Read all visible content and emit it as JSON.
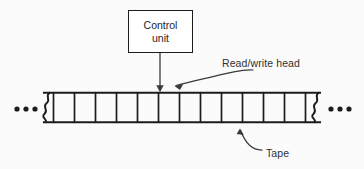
{
  "figure": {
    "background_color": "#fbfbfc",
    "ink_color": "#1c1c1c",
    "text_color": "#303030"
  },
  "control_unit": {
    "label_line1": "Control",
    "label_line2": "unit",
    "box": {
      "x": 128,
      "y": 10,
      "width": 65,
      "height": 43
    }
  },
  "connector": {
    "name": "control-unit-to-head-arrow",
    "from": {
      "x": 160,
      "y": 53
    },
    "to": {
      "x": 160,
      "y": 92
    },
    "arrowhead": "down"
  },
  "annotations": [
    {
      "id": "read-write-head",
      "label": "Read/write head",
      "text_x": 222,
      "text_y": 57,
      "arrow_from": {
        "x": 220,
        "y": 72
      },
      "arrow_to": {
        "x": 167,
        "y": 89
      }
    },
    {
      "id": "tape",
      "label": "Tape",
      "text_x": 266,
      "text_y": 147,
      "arrow_from": {
        "x": 258,
        "y": 152
      },
      "arrow_to": {
        "x": 239,
        "y": 127
      }
    }
  ],
  "tape": {
    "name": "turing-machine-tape",
    "left_edge_x": 44,
    "right_edge_x": 320,
    "top_y": 92,
    "bottom_y": 123,
    "cell_count": 13,
    "cell_values": [
      "",
      "",
      "",
      "",
      "",
      "",
      "",
      "",
      "",
      "",
      "",
      "",
      ""
    ],
    "head_cell_index": 5,
    "torn_edges": [
      "left",
      "right"
    ],
    "ellipsis_left": "•••",
    "ellipsis_right": "•••"
  }
}
